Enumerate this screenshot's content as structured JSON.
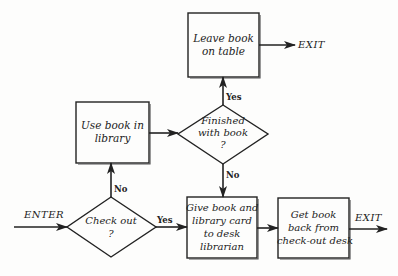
{
  "diagram": {
    "type": "flowchart",
    "nodes": {
      "leave_book": {
        "shape": "process",
        "lines": [
          "Leave book",
          "on table"
        ]
      },
      "finished": {
        "shape": "decision",
        "lines": [
          "Finished",
          "with book",
          "?"
        ]
      },
      "use_book": {
        "shape": "process",
        "lines": [
          "Use book in",
          "library"
        ]
      },
      "check_out": {
        "shape": "decision",
        "lines": [
          "Check out",
          "?"
        ]
      },
      "give_book": {
        "shape": "process",
        "lines": [
          "Give book and",
          "library card",
          "to desk",
          "librarian"
        ]
      },
      "get_book": {
        "shape": "process",
        "lines": [
          "Get book",
          "back from",
          "check-out desk"
        ]
      }
    },
    "terminals": {
      "enter": "ENTER",
      "exit_top": "EXIT",
      "exit_bottom": "EXIT"
    },
    "edge_labels": {
      "finished_yes": "Yes",
      "finished_no": "No",
      "checkout_no": "No",
      "checkout_yes": "Yes"
    },
    "edges": [
      {
        "from": "ENTER",
        "to": "check_out",
        "label": ""
      },
      {
        "from": "check_out",
        "to": "use_book",
        "label": "No"
      },
      {
        "from": "check_out",
        "to": "give_book",
        "label": "Yes"
      },
      {
        "from": "use_book",
        "to": "finished",
        "label": ""
      },
      {
        "from": "finished",
        "to": "leave_book",
        "label": "Yes"
      },
      {
        "from": "finished",
        "to": "give_book",
        "label": "No"
      },
      {
        "from": "leave_book",
        "to": "EXIT",
        "label": ""
      },
      {
        "from": "give_book",
        "to": "get_book",
        "label": ""
      },
      {
        "from": "get_book",
        "to": "EXIT",
        "label": ""
      }
    ]
  }
}
